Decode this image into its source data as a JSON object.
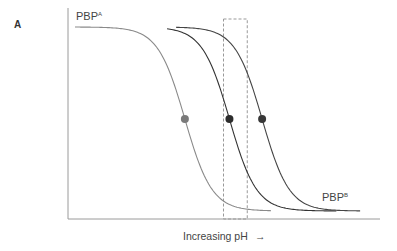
{
  "chart_data": {
    "type": "line",
    "panel_label": "A",
    "title": "",
    "xlabel": "Increasing pH",
    "xlabel_arrow": "→",
    "ylabel": "",
    "xlim": [
      0,
      100
    ],
    "ylim": [
      0,
      100
    ],
    "grid": false,
    "legend": "none",
    "series": [
      {
        "name": "curve-1",
        "color": "#8a8a8a",
        "midpoint_x": 37,
        "steepness": 0.22,
        "x_start": 0,
        "x_end": 66,
        "label": "PBP",
        "label_sup": "A",
        "label_position": "top-left",
        "marker_color": "#7a7a7a"
      },
      {
        "name": "curve-2",
        "color": "#333333",
        "midpoint_x": 52,
        "steepness": 0.22,
        "x_start": 31,
        "x_end": 88,
        "label": "",
        "label_sup": "",
        "label_position": "",
        "marker_color": "#2d2d2d"
      },
      {
        "name": "curve-3",
        "color": "#444444",
        "midpoint_x": 63,
        "steepness": 0.22,
        "x_start": 34,
        "x_end": 96,
        "label": "PBP",
        "label_sup": "B",
        "label_position": "bottom-right",
        "marker_color": "#383838"
      }
    ],
    "highlight_region": {
      "x_range": [
        50,
        58
      ],
      "style": "dashed",
      "color": "#999999"
    }
  }
}
